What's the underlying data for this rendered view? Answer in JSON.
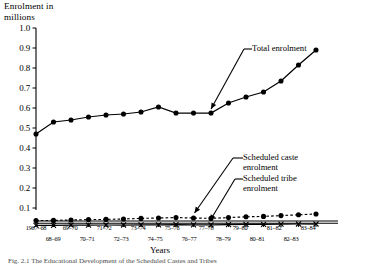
{
  "chart_data": {
    "type": "line",
    "title": "",
    "ylabel": "Enrolment in\nmillions",
    "xlabel": "Years",
    "ylim": [
      0.0,
      1.0
    ],
    "yticks": [
      "0.1",
      "0.2",
      "0.3",
      "0.4",
      "0.5",
      "0.6",
      "0.7",
      "0.8",
      "0.9",
      "1.0"
    ],
    "ytick_values": [
      0.1,
      0.2,
      0.3,
      0.4,
      0.5,
      0.6,
      0.7,
      0.8,
      0.9,
      1.0
    ],
    "grid": false,
    "legend_position": "inline-annotations",
    "categories": [
      "1967–68",
      "68–69",
      "69–70",
      "70–71",
      "71–72",
      "72–73",
      "73–74",
      "74–75",
      "75–76",
      "76–77",
      "77–78",
      "78–79",
      "79–80",
      "80–81",
      "81–82",
      "82–83",
      "83–84"
    ],
    "series": [
      {
        "name": "Total enrolment",
        "marker": "filled-circle",
        "linestyle": "solid",
        "values": [
          0.47,
          0.53,
          0.54,
          0.555,
          0.565,
          0.57,
          0.58,
          0.605,
          0.575,
          0.575,
          0.575,
          0.625,
          0.655,
          0.68,
          0.735,
          0.815,
          0.89
        ]
      },
      {
        "name": "Scheduled caste enrolment",
        "marker": "filled-circle",
        "linestyle": "dashed",
        "values": [
          0.037,
          0.038,
          0.04,
          0.042,
          0.043,
          0.045,
          0.048,
          0.05,
          0.052,
          0.05,
          0.048,
          0.052,
          0.056,
          0.058,
          0.062,
          0.066,
          0.07
        ]
      },
      {
        "name": "Scheduled tribe enrolment",
        "marker": "cross",
        "linestyle": "solid",
        "values": [
          0.013,
          0.013,
          0.014,
          0.014,
          0.015,
          0.015,
          0.016,
          0.016,
          0.017,
          0.016,
          0.016,
          0.017,
          0.018,
          0.018,
          0.019,
          0.02,
          0.02
        ]
      }
    ],
    "annotations": [
      {
        "label": "Total enrolment",
        "points_to": "77–78",
        "series": "Total enrolment"
      },
      {
        "label": "Scheduled caste\nenrolment",
        "points_to": "76–77",
        "series": "Scheduled caste enrolment"
      },
      {
        "label": "Scheduled tribe\nenrolment",
        "points_to": "77–78",
        "series": "Scheduled tribe enrolment"
      }
    ]
  },
  "caption": "Fig. 2.1  The Educational Development of the Scheduled Castes and Tribes",
  "colors": {
    "ink": "#000000",
    "axis": "#000000"
  }
}
